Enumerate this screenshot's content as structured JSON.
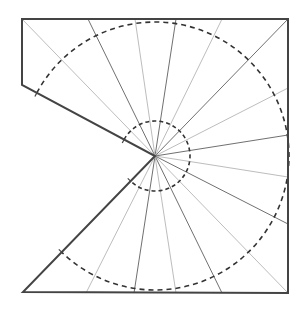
{
  "diagram": {
    "type": "cone-net",
    "width": 303,
    "height": 313,
    "colors": {
      "background": "#ffffff",
      "outline": "#444444",
      "dark_ray": "#707070",
      "light_ray": "#bdbdbd",
      "dashed_circle": "#333333"
    },
    "center": {
      "x": 155,
      "y": 156
    },
    "outline": [
      [
        22,
        19
      ],
      [
        288,
        19
      ],
      [
        288,
        293
      ],
      [
        23,
        292
      ],
      [
        155,
        156
      ],
      [
        22,
        85
      ]
    ],
    "circles": [
      {
        "name": "outer-dashed-circle",
        "r": 134
      },
      {
        "name": "inner-dashed-circle",
        "r": 35
      }
    ],
    "rays": [
      {
        "to": [
          22,
          19
        ],
        "tone": "light"
      },
      {
        "to": [
          88,
          19
        ],
        "tone": "dark"
      },
      {
        "to": [
          135,
          19
        ],
        "tone": "light"
      },
      {
        "to": [
          176,
          19
        ],
        "tone": "dark"
      },
      {
        "to": [
          222,
          19
        ],
        "tone": "light"
      },
      {
        "to": [
          288,
          19
        ],
        "tone": "dark"
      },
      {
        "to": [
          288,
          88
        ],
        "tone": "light"
      },
      {
        "to": [
          288,
          135
        ],
        "tone": "dark"
      },
      {
        "to": [
          288,
          177
        ],
        "tone": "light"
      },
      {
        "to": [
          288,
          224
        ],
        "tone": "dark"
      },
      {
        "to": [
          288,
          293
        ],
        "tone": "light"
      },
      {
        "to": [
          222,
          293
        ],
        "tone": "dark"
      },
      {
        "to": [
          176,
          293
        ],
        "tone": "light"
      },
      {
        "to": [
          134,
          293
        ],
        "tone": "dark"
      },
      {
        "to": [
          86,
          293
        ],
        "tone": "light"
      }
    ],
    "cut_edges": [
      {
        "from": [
          155,
          156
        ],
        "to": [
          22,
          85
        ]
      },
      {
        "from": [
          155,
          156
        ],
        "to": [
          23,
          292
        ]
      }
    ]
  }
}
